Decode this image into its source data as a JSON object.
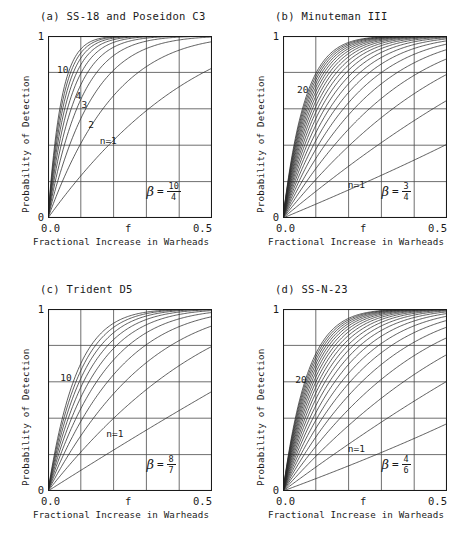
{
  "figure": {
    "panels": [
      {
        "id": "a",
        "title": "(a) SS-18 and Poseidon C3",
        "beta_label": "β",
        "equals": "=",
        "beta_numerator": "10",
        "beta_denominator": "4",
        "beta_value": 2.5,
        "curve_labels": [
          {
            "text": "10",
            "x": 0.055,
            "y": 0.845
          },
          {
            "text": "4",
            "x": 0.168,
            "y": 0.705
          },
          {
            "text": "3",
            "x": 0.205,
            "y": 0.655
          },
          {
            "text": "2",
            "x": 0.245,
            "y": 0.545
          },
          {
            "text": "n=1",
            "x": 0.315,
            "y": 0.455
          }
        ]
      },
      {
        "id": "b",
        "title": "(b) Minuteman III",
        "beta_label": "β",
        "equals": "=",
        "beta_numerator": "3",
        "beta_denominator": "4",
        "beta_value": 0.75,
        "curve_labels": [
          {
            "text": "20",
            "x": 0.085,
            "y": 0.735
          },
          {
            "text": "n=1",
            "x": 0.395,
            "y": 0.215
          }
        ]
      },
      {
        "id": "c",
        "title": "(c) Trident D5",
        "beta_label": "β",
        "equals": "=",
        "beta_numerator": "8",
        "beta_denominator": "7",
        "beta_value": 1.1428,
        "curve_labels": [
          {
            "text": "10",
            "x": 0.075,
            "y": 0.655
          },
          {
            "text": "n=1",
            "x": 0.355,
            "y": 0.345
          }
        ]
      },
      {
        "id": "d",
        "title": "(d) SS-N-23",
        "beta_label": "β",
        "equals": "=",
        "beta_numerator": "4",
        "beta_denominator": "6",
        "beta_value": 0.6667,
        "curve_labels": [
          {
            "text": "20",
            "x": 0.075,
            "y": 0.645
          },
          {
            "text": "n=1",
            "x": 0.395,
            "y": 0.265
          }
        ]
      }
    ],
    "axes": {
      "ylabel": "Probability of Detection",
      "xlabel": "Fractional Increase in Warheads",
      "ytick_top": "1",
      "ytick_bottom": "0",
      "xtick_left": "0.0",
      "xtick_mid": "f",
      "xtick_right": "0.5"
    },
    "colors": {
      "ink": "#1a1a1a",
      "grid": "#4a4a4a",
      "curve": "#2a2a2a",
      "background": "#ffffff"
    }
  },
  "chart_data": {
    "type": "line",
    "xlabel": "Fractional Increase in Warheads",
    "ylabel": "Probability of Detection",
    "xlim": [
      0,
      0.5
    ],
    "ylim": [
      0,
      1
    ],
    "xticks": [
      0.0,
      0.25,
      0.5
    ],
    "xticklabels": [
      "0.0",
      "f",
      "0.5"
    ],
    "yticks": [
      0,
      1
    ],
    "yticklabels": [
      "0",
      "1"
    ],
    "grid": true,
    "grid_x_divisions": 5,
    "grid_y_divisions": 5,
    "legend": "none",
    "formula": "P = 1 - (1 - f)^(beta * n)",
    "panels": [
      {
        "id": "a",
        "title": "(a) SS-18 and Poseidon C3",
        "beta": 2.5,
        "beta_fraction": "10/4",
        "n_values": [
          1,
          2,
          3,
          4,
          5,
          6,
          7,
          8,
          9,
          10
        ],
        "n_min": 1,
        "n_max": 10,
        "annotations": [
          "10",
          "4",
          "3",
          "2",
          "n=1"
        ]
      },
      {
        "id": "b",
        "title": "(b) Minuteman III",
        "beta": 0.75,
        "beta_fraction": "3/4",
        "n_values": [
          1,
          2,
          3,
          4,
          5,
          6,
          7,
          8,
          9,
          10,
          11,
          12,
          13,
          14,
          15,
          16,
          17,
          18,
          19,
          20
        ],
        "n_min": 1,
        "n_max": 20,
        "annotations": [
          "20",
          "n=1"
        ]
      },
      {
        "id": "c",
        "title": "(c) Trident D5",
        "beta": 1.1428571,
        "beta_fraction": "8/7",
        "n_values": [
          1,
          2,
          3,
          4,
          5,
          6,
          7,
          8,
          9,
          10
        ],
        "n_min": 1,
        "n_max": 10,
        "annotations": [
          "10",
          "n=1"
        ]
      },
      {
        "id": "d",
        "title": "(d) SS-N-23",
        "beta": 0.6666667,
        "beta_fraction": "4/6",
        "n_values": [
          1,
          2,
          3,
          4,
          5,
          6,
          7,
          8,
          9,
          10,
          11,
          12,
          13,
          14,
          15,
          16,
          17,
          18,
          19,
          20
        ],
        "n_min": 1,
        "n_max": 20,
        "annotations": [
          "20",
          "n=1"
        ]
      }
    ]
  }
}
